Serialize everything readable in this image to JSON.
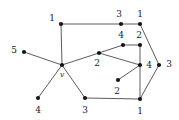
{
  "figure": {
    "width": 179,
    "height": 120,
    "background_color": "#ffffff",
    "edge_color": "#4a4a4a",
    "vertex_color": "#151515",
    "label_color": "#1a1a1a"
  },
  "vertices": [
    {
      "id": "v",
      "label": "v",
      "style": "italic",
      "x": 62,
      "y": 65,
      "lx": 62,
      "ly": 74
    },
    {
      "id": "n1",
      "label": "1",
      "style": "normal",
      "x": 61,
      "y": 24,
      "lx": 52,
      "ly": 18
    },
    {
      "id": "n2",
      "label": "5",
      "style": "normal",
      "x": 24,
      "y": 52,
      "lx": 14,
      "ly": 50
    },
    {
      "id": "n3",
      "label": "4",
      "style": "normal",
      "x": 38,
      "y": 98,
      "lx": 38,
      "ly": 110
    },
    {
      "id": "n4",
      "label": "3",
      "style": "normal",
      "x": 85,
      "y": 98,
      "lx": 85,
      "ly": 110
    },
    {
      "id": "n5",
      "label": "2",
      "style": "normal",
      "x": 99,
      "y": 53,
      "lx": 97,
      "ly": 63
    },
    {
      "id": "n6",
      "label": "3",
      "style": "normal",
      "x": 121,
      "y": 24,
      "lx": 119,
      "ly": 14
    },
    {
      "id": "n7",
      "label": "1",
      "style": "normal",
      "x": 140,
      "y": 24,
      "lx": 140,
      "ly": 14
    },
    {
      "id": "n8",
      "label": "4",
      "style": "normal",
      "x": 123,
      "y": 45,
      "lx": 121,
      "ly": 35
    },
    {
      "id": "n9",
      "label": "2",
      "style": "normal",
      "x": 140,
      "y": 45,
      "lx": 139,
      "ly": 35
    },
    {
      "id": "n10",
      "label": "4",
      "style": "normal",
      "x": 140,
      "y": 65,
      "lx": 149,
      "ly": 65
    },
    {
      "id": "n11",
      "label": "3",
      "style": "normal",
      "x": 159,
      "y": 65,
      "lx": 169,
      "ly": 64
    },
    {
      "id": "n12",
      "label": "2",
      "style": "normal",
      "x": 118,
      "y": 80,
      "lx": 117,
      "ly": 91
    },
    {
      "id": "n13",
      "label": "1",
      "style": "normal",
      "x": 140,
      "y": 99,
      "lx": 140,
      "ly": 111
    }
  ],
  "edges": [
    {
      "from": "v",
      "to": "n1"
    },
    {
      "from": "v",
      "to": "n2"
    },
    {
      "from": "v",
      "to": "n3"
    },
    {
      "from": "v",
      "to": "n4"
    },
    {
      "from": "v",
      "to": "n5"
    },
    {
      "from": "n1",
      "to": "n6"
    },
    {
      "from": "n6",
      "to": "n7"
    },
    {
      "from": "n7",
      "to": "n11"
    },
    {
      "from": "n5",
      "to": "n8"
    },
    {
      "from": "n8",
      "to": "n9"
    },
    {
      "from": "n9",
      "to": "n10"
    },
    {
      "from": "n5",
      "to": "n10"
    },
    {
      "from": "n10",
      "to": "n12"
    },
    {
      "from": "n10",
      "to": "n13"
    },
    {
      "from": "n11",
      "to": "n13"
    },
    {
      "from": "n4",
      "to": "n13"
    }
  ]
}
